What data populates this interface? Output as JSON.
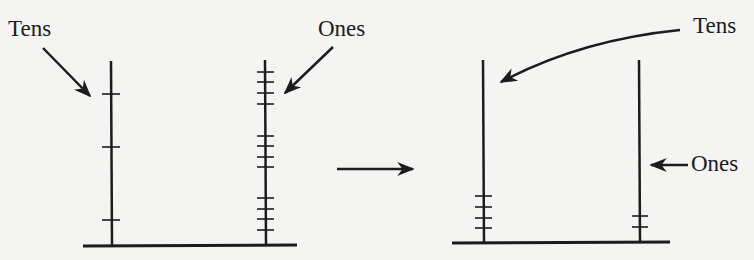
{
  "colors": {
    "background": "#f4f4f2",
    "ink": "#1c1c1c"
  },
  "before": {
    "tens_label": "Tens",
    "ones_label": "Ones",
    "tens_ticks": 3,
    "ones_ticks": 12,
    "ones_tick_grouping": [
      4,
      4,
      4
    ]
  },
  "transition_arrow": "right-arrow",
  "after": {
    "tens_label": "Tens",
    "ones_label": "Ones",
    "tens_ticks": 4,
    "ones_ticks": 2
  }
}
